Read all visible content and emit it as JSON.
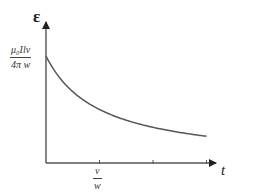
{
  "chart_data": {
    "type": "line",
    "title": "",
    "xlabel": "t",
    "ylabel": "ε",
    "x_ticks": [
      {
        "label": "v/w",
        "num": "v",
        "den": "w",
        "x": 1
      },
      {
        "label": "",
        "x": 2
      },
      {
        "label": "",
        "x": 3
      }
    ],
    "y_ticks": [
      {
        "label": "μ₀Ilv / 4πw",
        "num": "μ₀Ilv",
        "den": "4π w",
        "y": 1
      }
    ],
    "series": [
      {
        "name": "ε(t)",
        "x": [
          0,
          0.25,
          0.5,
          0.75,
          1,
          1.5,
          2,
          2.5,
          3
        ],
        "y": [
          1.0,
          0.8,
          0.67,
          0.57,
          0.5,
          0.4,
          0.33,
          0.29,
          0.25
        ]
      }
    ],
    "grid": false,
    "legend": null
  },
  "axes": {
    "y_symbol": "ε",
    "x_symbol": "t",
    "y_value_num": "μ₀Ilv",
    "y_value_den": "4π w",
    "x_tick_num": "v",
    "x_tick_den": "w"
  },
  "colors": {
    "axis": "#555555",
    "curve": "#555555",
    "text": "#222222"
  }
}
